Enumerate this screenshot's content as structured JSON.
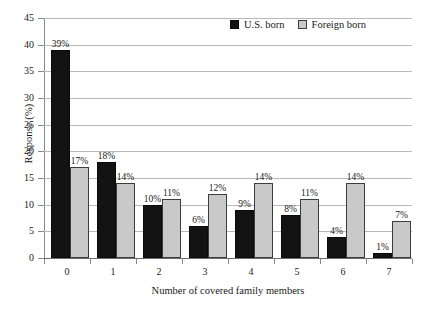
{
  "chart_data": {
    "type": "bar",
    "title": "",
    "xlabel": "Number of covered family members",
    "ylabel": "Response (%)",
    "categories": [
      "0",
      "1",
      "2",
      "3",
      "4",
      "5",
      "6",
      "7"
    ],
    "series": [
      {
        "name": "U.S. born",
        "color": "#131313",
        "values": [
          39,
          18,
          10,
          6,
          9,
          8,
          4,
          1
        ],
        "labels": [
          "39%",
          "18%",
          "10%",
          "6%",
          "9%",
          "8%",
          "4%",
          "1%"
        ]
      },
      {
        "name": "Foreign born",
        "color": "#c9c9c9",
        "values": [
          17,
          14,
          11,
          12,
          14,
          11,
          14,
          7
        ],
        "labels": [
          "17%",
          "14%",
          "11%",
          "12%",
          "14%",
          "11%",
          "14%",
          "7%"
        ]
      }
    ],
    "ylim": [
      0,
      45
    ],
    "yticks": [
      0,
      5,
      10,
      15,
      20,
      25,
      30,
      35,
      40,
      45
    ],
    "ytick_labels": [
      "0",
      "5",
      "10",
      "15",
      "20",
      "25",
      "30",
      "35",
      "40",
      "45"
    ],
    "grid": true,
    "legend_position": "top-right"
  },
  "legend": {
    "items": [
      {
        "label": "U.S. born",
        "swatch": "us"
      },
      {
        "label": "Foreign born",
        "swatch": "foreign"
      }
    ]
  }
}
